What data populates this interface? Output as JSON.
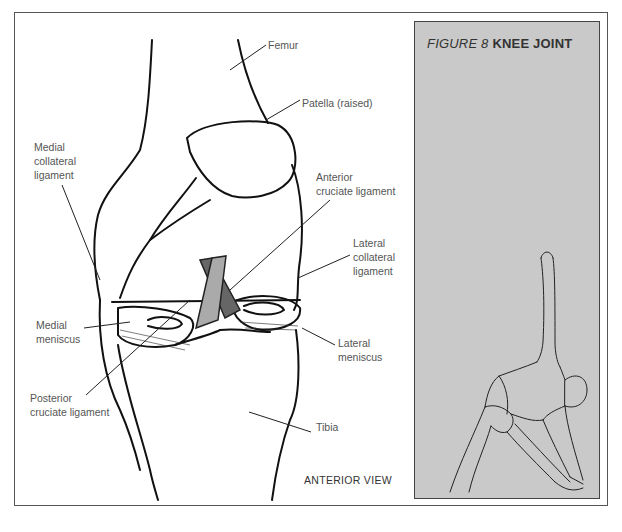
{
  "figure": {
    "number_label": "FIGURE 8",
    "title": "KNEE JOINT",
    "view_label": "ANTERIOR VIEW",
    "panel_background": "#c9c9c9"
  },
  "labels": {
    "femur": "Femur",
    "patella": "Patella (raised)",
    "medial_collateral": "Medial\ncollateral\nligament",
    "anterior_cruciate": "Anterior\ncruciate ligament",
    "lateral_collateral": "Lateral\ncollateral\nligament",
    "medial_meniscus": "Medial\nmeniscus",
    "lateral_meniscus": "Lateral\nmeniscus",
    "posterior_cruciate": "Posterior\ncruciate ligament",
    "tibia": "Tibia"
  },
  "illustrations": {
    "main": "knee-joint-anterior-drawing",
    "inset": "triangle-pose-figure"
  }
}
